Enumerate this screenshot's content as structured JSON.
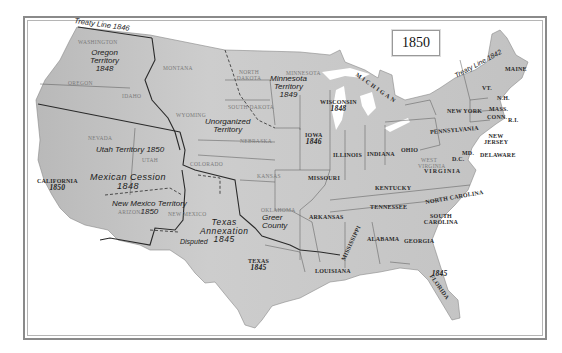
{
  "map": {
    "year": "1850",
    "colors": {
      "land": "#c4c4c4",
      "land_dark": "#a9a9a9",
      "water": "#ffffff",
      "border": "#333333",
      "frame": "#8a8a8a"
    },
    "territory_labels": [
      {
        "id": "treaty-line-1846",
        "text": "Treaty Line 1846"
      },
      {
        "id": "oregon-territory",
        "text": "Oregon\nTerritory\n1848"
      },
      {
        "id": "minnesota-territory",
        "text": "Minnesota\nTerritory\n1849"
      },
      {
        "id": "unorganized-territory",
        "text": "Unorganized\nTerritory"
      },
      {
        "id": "utah-territory",
        "text": "Utah Territory 1850"
      },
      {
        "id": "mexican-cession",
        "text": "Mexican Cession\n1848"
      },
      {
        "id": "new-mexico-territory",
        "text": "New Mexico Territory\n1850"
      },
      {
        "id": "texas-annexation",
        "text": "Texas\nAnnexation\n1845"
      },
      {
        "id": "disputed",
        "text": "Disputed"
      },
      {
        "id": "greer-county",
        "text": "Greer\nCounty"
      },
      {
        "id": "treaty-line-1842",
        "text": "Treaty Line 1842"
      }
    ],
    "states": [
      {
        "name": "CALIFORNIA",
        "year": "1850"
      },
      {
        "name": "TEXAS",
        "year": "1845"
      },
      {
        "name": "IOWA",
        "year": "1846"
      },
      {
        "name": "WISCONSIN",
        "year": "1848"
      },
      {
        "name": "FLORIDA",
        "year": "1845"
      },
      {
        "name": "MISSOURI"
      },
      {
        "name": "ARKANSAS"
      },
      {
        "name": "LOUISIANA"
      },
      {
        "name": "ILLINOIS"
      },
      {
        "name": "INDIANA"
      },
      {
        "name": "OHIO"
      },
      {
        "name": "MICHIGAN"
      },
      {
        "name": "KENTUCKY"
      },
      {
        "name": "TENNESSEE"
      },
      {
        "name": "MISSISSIPPI"
      },
      {
        "name": "ALABAMA"
      },
      {
        "name": "GEORGIA"
      },
      {
        "name": "SOUTH CAROLINA"
      },
      {
        "name": "NORTH CAROLINA"
      },
      {
        "name": "VIRGINIA"
      },
      {
        "name": "PENNSYLVANIA"
      },
      {
        "name": "NEW YORK"
      },
      {
        "name": "NEW JERSEY"
      },
      {
        "name": "DELAWARE"
      },
      {
        "name": "MD."
      },
      {
        "name": "D.C."
      },
      {
        "name": "VT."
      },
      {
        "name": "N.H."
      },
      {
        "name": "MAINE"
      },
      {
        "name": "MASS."
      },
      {
        "name": "CONN."
      },
      {
        "name": "R.I."
      }
    ],
    "modern_state_labels": [
      "WASHINGTON",
      "OREGON",
      "IDAHO",
      "MONTANA",
      "WYOMING",
      "NORTH DAKOTA",
      "SOUTH DAKOTA",
      "MINNESOTA",
      "NEBRASKA",
      "KANSAS",
      "COLORADO",
      "NEVADA",
      "UTAH",
      "ARIZONA",
      "NEW MEXICO",
      "OKLAHOMA",
      "WEST VIRGINIA"
    ]
  }
}
